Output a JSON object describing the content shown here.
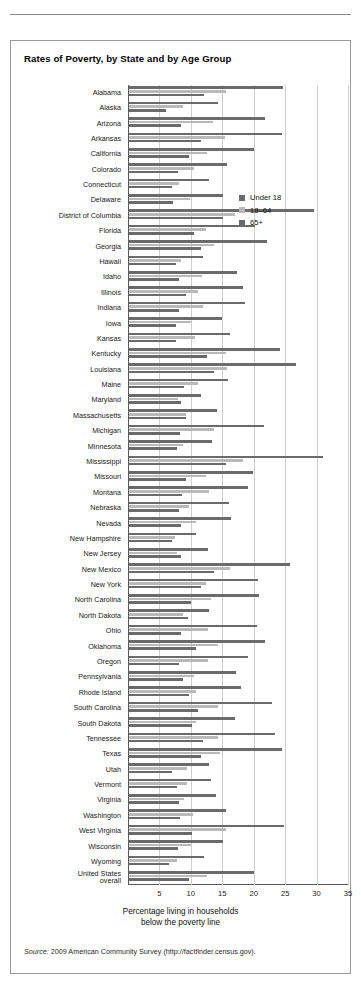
{
  "page": {
    "crumb": ""
  },
  "figure": {
    "title": "Rates of Poverty, by State and by Age Group",
    "source_label": "Source:",
    "source_text": " 2009 American Community Survey (http://factfinder.census.gov)."
  },
  "legend": {
    "position": "inside-top-right",
    "items": [
      {
        "label": "Under 18",
        "color": "#6a6a6a",
        "key": "under_18"
      },
      {
        "label": "18–64",
        "color": "#b9b9b9",
        "key": "age_18_64"
      },
      {
        "label": "65+",
        "color": "#6a6a6a",
        "key": "age_65_plus"
      }
    ]
  },
  "chart_data": {
    "type": "bar",
    "orientation": "horizontal",
    "title": "Rates of Poverty, by State and by Age Group",
    "xlabel": "Percentage living in households below the poverty line",
    "ylabel": "",
    "xlim": [
      0,
      35
    ],
    "xticks": [
      5,
      10,
      15,
      20,
      25,
      30,
      35
    ],
    "grid": "vertical",
    "categories": [
      "Alabama",
      "Alaska",
      "Arizona",
      "Arkansas",
      "California",
      "Colorado",
      "Connecticut",
      "Delaware",
      "District of Columbia",
      "Florida",
      "Georgia",
      "Hawaii",
      "Idaho",
      "Illinois",
      "Indiana",
      "Iowa",
      "Kansas",
      "Kentucky",
      "Louisiana",
      "Maine",
      "Maryland",
      "Massachusetts",
      "Michigan",
      "Minnesota",
      "Mississippi",
      "Missouri",
      "Montana",
      "Nebraska",
      "Nevada",
      "New Hampshire",
      "New Jersey",
      "New Mexico",
      "New York",
      "North Carolina",
      "North Dakota",
      "Ohio",
      "Oklahoma",
      "Oregon",
      "Pennsylvania",
      "Rhode Island",
      "South Carolina",
      "South Dakota",
      "Tennessee",
      "Texas",
      "Utah",
      "Vermont",
      "Virginia",
      "Washington",
      "West Virginia",
      "Wisconsin",
      "Wyoming",
      "United States overall"
    ],
    "series": [
      {
        "name": "Under 18",
        "color": "#6a6a6a",
        "values": [
          24.5,
          14.2,
          21.6,
          24.3,
          19.9,
          15.6,
          12.8,
          14.9,
          29.4,
          20.0,
          22.0,
          11.8,
          17.2,
          18.1,
          18.5,
          14.8,
          16.1,
          24.0,
          26.5,
          15.8,
          11.5,
          14.0,
          21.4,
          13.2,
          30.9,
          19.7,
          18.9,
          15.9,
          16.2,
          10.6,
          12.5,
          25.6,
          20.5,
          20.7,
          12.8,
          20.3,
          21.7,
          18.9,
          17.1,
          17.8,
          22.7,
          16.9,
          23.2,
          24.3,
          12.8,
          13.0,
          13.8,
          15.4,
          24.6,
          14.9,
          11.9,
          19.9
        ]
      },
      {
        "name": "18–64",
        "color": "#b9b9b9",
        "values": [
          15.4,
          8.6,
          13.4,
          15.2,
          12.4,
          10.4,
          8.0,
          9.7,
          16.9,
          12.2,
          13.6,
          8.2,
          11.6,
          10.9,
          11.7,
          9.8,
          10.5,
          15.5,
          15.6,
          11.0,
          7.8,
          9.0,
          13.5,
          8.6,
          18.1,
          12.2,
          12.7,
          9.5,
          10.7,
          7.3,
          7.6,
          16.0,
          12.3,
          13.1,
          8.6,
          12.6,
          14.1,
          12.5,
          10.4,
          10.6,
          14.2,
          10.6,
          14.2,
          14.4,
          9.3,
          9.2,
          8.7,
          10.2,
          15.4,
          9.8,
          7.6,
          12.4
        ]
      },
      {
        "name": "65+",
        "color": "#6a6a6a",
        "values": [
          12.0,
          5.9,
          8.2,
          11.4,
          9.6,
          7.8,
          6.9,
          7.0,
          15.0,
          10.3,
          11.5,
          7.4,
          7.9,
          9.0,
          7.9,
          7.4,
          7.5,
          12.4,
          13.6,
          8.7,
          8.2,
          9.0,
          8.1,
          7.6,
          15.4,
          9.1,
          8.5,
          7.9,
          8.2,
          6.8,
          8.2,
          13.5,
          11.4,
          9.9,
          9.4,
          8.2,
          10.6,
          8.0,
          8.6,
          9.6,
          11.0,
          10.0,
          11.8,
          11.5,
          6.8,
          7.6,
          7.9,
          8.1,
          10.0,
          7.8,
          6.4,
          9.5
        ]
      }
    ]
  }
}
